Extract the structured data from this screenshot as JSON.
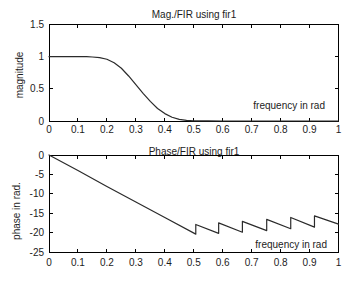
{
  "figure": {
    "background": "#ffffff",
    "axis_color": "#000000",
    "curve_color": "#2b2b2b",
    "text_color": "#1c1c1c"
  },
  "chart_data": [
    {
      "type": "line",
      "title": "Mag./FIR using fir1",
      "ylabel": "magnitude",
      "annotation": "frequency in rad",
      "xlim": [
        0,
        1
      ],
      "ylim": [
        0,
        1.5
      ],
      "grid": false,
      "legend": null,
      "xticks": [
        "0",
        "0.1",
        "0.2",
        "0.3",
        "0.4",
        "0.5",
        "0.6",
        "0.7",
        "0.8",
        "0.9",
        "1"
      ],
      "xtick_values": [
        0,
        0.1,
        0.2,
        0.3,
        0.4,
        0.5,
        0.6,
        0.7,
        0.8,
        0.9,
        1
      ],
      "yticks": [
        "0",
        "0.5",
        "1",
        "1.5"
      ],
      "ytick_values": [
        0,
        0.5,
        1,
        1.5
      ],
      "series": [
        {
          "name": "magnitude response",
          "points": [
            [
              0,
              1
            ],
            [
              0.05,
              1
            ],
            [
              0.1,
              1
            ],
            [
              0.13,
              1
            ],
            [
              0.15,
              0.995
            ],
            [
              0.175,
              0.985
            ],
            [
              0.2,
              0.96
            ],
            [
              0.225,
              0.905
            ],
            [
              0.25,
              0.82
            ],
            [
              0.275,
              0.7
            ],
            [
              0.3,
              0.565
            ],
            [
              0.325,
              0.43
            ],
            [
              0.35,
              0.305
            ],
            [
              0.375,
              0.195
            ],
            [
              0.4,
              0.115
            ],
            [
              0.425,
              0.058
            ],
            [
              0.45,
              0.025
            ],
            [
              0.475,
              0.009
            ],
            [
              0.5,
              0.003
            ],
            [
              0.55,
              0.001
            ],
            [
              0.6,
              0
            ],
            [
              0.7,
              0
            ],
            [
              0.8,
              0
            ],
            [
              0.9,
              0
            ],
            [
              1,
              0
            ]
          ]
        }
      ]
    },
    {
      "type": "line",
      "title": "Phase/FIR using fir1",
      "ylabel": "phase in rad.",
      "annotation": "frequency in rad",
      "xlim": [
        0,
        1
      ],
      "ylim": [
        -25,
        0
      ],
      "grid": false,
      "legend": null,
      "xticks": [
        "0",
        "0.1",
        "0.2",
        "0.3",
        "0.4",
        "0.5",
        "0.6",
        "0.7",
        "0.8",
        "0.9",
        "1"
      ],
      "xtick_values": [
        0,
        0.1,
        0.2,
        0.3,
        0.4,
        0.5,
        0.6,
        0.7,
        0.8,
        0.9,
        1
      ],
      "yticks": [
        "0",
        "-5",
        "-10",
        "-15",
        "-20",
        "-25"
      ],
      "ytick_values": [
        0,
        -5,
        -10,
        -15,
        -20,
        -25
      ],
      "series": [
        {
          "name": "phase response",
          "points": [
            [
              0,
              0
            ],
            [
              0.1,
              -4.0
            ],
            [
              0.2,
              -8.1
            ],
            [
              0.3,
              -12.1
            ],
            [
              0.4,
              -16.1
            ],
            [
              0.507,
              -20.4
            ],
            [
              0.507,
              -17.9
            ],
            [
              0.586,
              -20.2
            ],
            [
              0.586,
              -17.5
            ],
            [
              0.668,
              -19.9
            ],
            [
              0.668,
              -17.1
            ],
            [
              0.752,
              -19.5
            ],
            [
              0.752,
              -16.6
            ],
            [
              0.835,
              -19.0
            ],
            [
              0.835,
              -16.1
            ],
            [
              0.917,
              -18.6
            ],
            [
              0.917,
              -15.7
            ],
            [
              1,
              -17.8
            ]
          ]
        }
      ]
    }
  ]
}
